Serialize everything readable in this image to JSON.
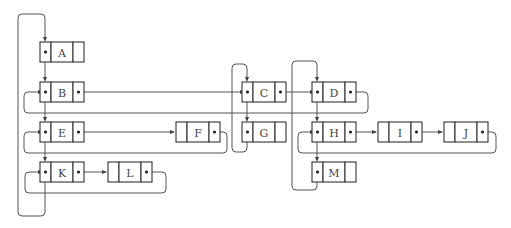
{
  "diagram": {
    "type": "linked-node-structure",
    "nodes": [
      {
        "id": "A",
        "label": "A",
        "x": 40,
        "y": 42,
        "leftDot": true,
        "rightDot": false
      },
      {
        "id": "B",
        "label": "B",
        "x": 40,
        "y": 82,
        "leftDot": true,
        "rightDot": true
      },
      {
        "id": "E",
        "label": "E",
        "x": 40,
        "y": 122,
        "leftDot": true,
        "rightDot": true
      },
      {
        "id": "K",
        "label": "K",
        "x": 40,
        "y": 162,
        "leftDot": true,
        "rightDot": true
      },
      {
        "id": "L",
        "label": "L",
        "x": 108,
        "y": 162,
        "leftDot": false,
        "rightDot": true
      },
      {
        "id": "F",
        "label": "F",
        "x": 176,
        "y": 122,
        "leftDot": false,
        "rightDot": true
      },
      {
        "id": "C",
        "label": "C",
        "x": 242,
        "y": 82,
        "leftDot": true,
        "rightDot": true
      },
      {
        "id": "G",
        "label": "G",
        "x": 242,
        "y": 122,
        "leftDot": true,
        "rightDot": false
      },
      {
        "id": "D",
        "label": "D",
        "x": 312,
        "y": 82,
        "leftDot": true,
        "rightDot": true
      },
      {
        "id": "H",
        "label": "H",
        "x": 312,
        "y": 122,
        "leftDot": true,
        "rightDot": true
      },
      {
        "id": "M",
        "label": "M",
        "x": 312,
        "y": 162,
        "leftDot": true,
        "rightDot": false
      },
      {
        "id": "I",
        "label": "I",
        "x": 378,
        "y": 122,
        "leftDot": false,
        "rightDot": true
      },
      {
        "id": "J",
        "label": "J",
        "x": 444,
        "y": 122,
        "leftDot": false,
        "rightDot": true
      }
    ],
    "edges": [
      {
        "from": "A",
        "to": "B",
        "kind": "down"
      },
      {
        "from": "B",
        "to": "E",
        "kind": "down"
      },
      {
        "from": "E",
        "to": "K",
        "kind": "down"
      },
      {
        "from": "K",
        "to": "A",
        "kind": "outer-loop"
      },
      {
        "from": "B",
        "to": "C",
        "kind": "right"
      },
      {
        "from": "C",
        "to": "D",
        "kind": "right"
      },
      {
        "from": "D",
        "to": "B",
        "kind": "wrap"
      },
      {
        "from": "E",
        "to": "F",
        "kind": "right"
      },
      {
        "from": "F",
        "to": "E",
        "kind": "wrap"
      },
      {
        "from": "K",
        "to": "L",
        "kind": "right"
      },
      {
        "from": "L",
        "to": "K",
        "kind": "wrap"
      },
      {
        "from": "C",
        "to": "G",
        "kind": "down"
      },
      {
        "from": "G",
        "to": "C",
        "kind": "loop"
      },
      {
        "from": "D",
        "to": "H",
        "kind": "down"
      },
      {
        "from": "H",
        "to": "M",
        "kind": "down"
      },
      {
        "from": "M",
        "to": "D",
        "kind": "loop"
      },
      {
        "from": "H",
        "to": "I",
        "kind": "right"
      },
      {
        "from": "I",
        "to": "J",
        "kind": "right"
      },
      {
        "from": "J",
        "to": "H",
        "kind": "wrap"
      }
    ]
  }
}
